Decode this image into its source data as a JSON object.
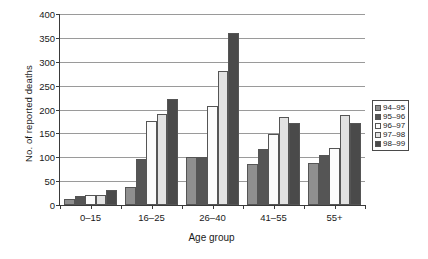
{
  "chart_data": {
    "type": "bar",
    "title": "",
    "xlabel": "Age group",
    "ylabel": "No. of reported deaths",
    "categories": [
      "0–15",
      "16–25",
      "26–40",
      "41–55",
      "55+"
    ],
    "ylim": [
      0,
      400
    ],
    "yticks": [
      0,
      50,
      100,
      150,
      200,
      250,
      300,
      350,
      400
    ],
    "grid": true,
    "legend_position": "right",
    "series": [
      {
        "name": "94–95",
        "color": "#8f8f8f",
        "values": [
          12,
          38,
          100,
          85,
          88
        ]
      },
      {
        "name": "95–96",
        "color": "#555555",
        "values": [
          18,
          97,
          100,
          118,
          105
        ]
      },
      {
        "name": "96–97",
        "color": "#fbfbfb",
        "values": [
          20,
          175,
          207,
          148,
          120
        ]
      },
      {
        "name": "97–98",
        "color": "#e2e2e2",
        "values": [
          22,
          190,
          280,
          185,
          188
        ]
      },
      {
        "name": "98–99",
        "color": "#4a4a4a",
        "values": [
          32,
          222,
          360,
          172,
          172
        ]
      }
    ]
  }
}
